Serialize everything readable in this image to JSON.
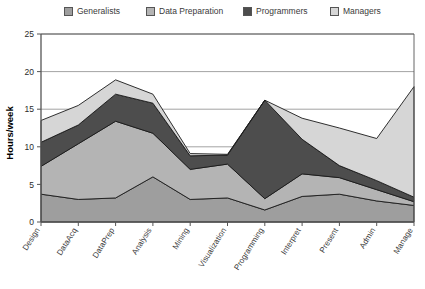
{
  "chart_data": {
    "type": "area",
    "stacked": true,
    "title": "",
    "xlabel": "",
    "ylabel": "Hours/week",
    "ylim": [
      0,
      25
    ],
    "yticks": [
      0,
      5,
      10,
      15,
      20,
      25
    ],
    "grid": true,
    "legend_position": "top",
    "categories": [
      "Design",
      "DataAcq",
      "DataPrep",
      "Analysis",
      "Mining",
      "Visualization",
      "Programming",
      "Interpret",
      "Present",
      "Admin",
      "Manage"
    ],
    "series": [
      {
        "name": "Generalists",
        "color": "#9e9e9e",
        "values": [
          3.7,
          3.0,
          3.2,
          6.0,
          3.0,
          3.2,
          1.6,
          3.4,
          3.7,
          2.8,
          2.2
        ]
      },
      {
        "name": "Data Preparation",
        "color": "#b4b4b4",
        "values": [
          3.7,
          7.4,
          10.2,
          5.8,
          4.0,
          4.5,
          1.5,
          3.0,
          2.2,
          1.5,
          0.5
        ]
      },
      {
        "name": "Programmers",
        "color": "#4d4d4d",
        "values": [
          3.2,
          2.5,
          3.6,
          4.0,
          1.8,
          1.2,
          13.1,
          4.6,
          1.6,
          1.2,
          0.6
        ]
      },
      {
        "name": "Managers",
        "color": "#d6d6d6",
        "values": [
          2.9,
          2.6,
          1.9,
          1.2,
          0.3,
          0.1,
          0.0,
          2.8,
          5.0,
          5.6,
          14.7
        ]
      }
    ],
    "totals": [
      13.5,
      15.5,
      18.9,
      17.0,
      9.1,
      9.0,
      16.2,
      13.8,
      12.5,
      11.1,
      18.0
    ]
  },
  "legend": {
    "items": [
      {
        "label": "Generalists",
        "color": "#9e9e9e"
      },
      {
        "label": "Data Preparation",
        "color": "#b4b4b4"
      },
      {
        "label": "Programmers",
        "color": "#4d4d4d"
      },
      {
        "label": "Managers",
        "color": "#d6d6d6"
      }
    ]
  },
  "axis": {
    "y_label": "Hours/week",
    "y_ticks": [
      "0",
      "5",
      "10",
      "15",
      "20",
      "25"
    ]
  }
}
